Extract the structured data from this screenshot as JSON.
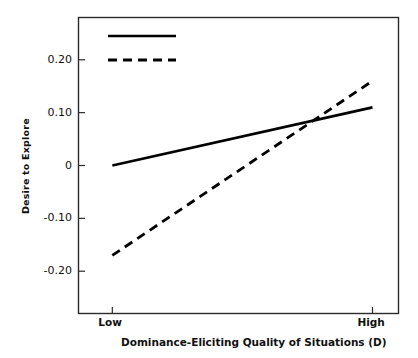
{
  "chart_data": {
    "type": "line",
    "title": "",
    "subtitle": "",
    "xlabel": "Dominance-Eliciting Quality of Situations (D)",
    "xlabel_plain": "Dominance-Eliciting Quality of Situations",
    "xlabel_bold_suffix": "(D)",
    "ylabel": "Desire to Explore",
    "categories": [
      "Low",
      "High"
    ],
    "x": [
      0,
      1
    ],
    "xtick_labels": [
      "Low",
      "High"
    ],
    "ytick_labels": [
      "0.20",
      "0.10",
      "0",
      "-0.10",
      "-0.20"
    ],
    "ytick_values": [
      0.2,
      0.1,
      0,
      -0.1,
      -0.2
    ],
    "ylim": [
      -0.28,
      0.28
    ],
    "xlim": [
      -0.13,
      1.1
    ],
    "grid": false,
    "legend_position": "top-left-inside",
    "series": [
      {
        "name": "Male",
        "style": "solid",
        "color": "#000000",
        "values": [
          0.0,
          0.11
        ]
      },
      {
        "name": "Female",
        "style": "dashed",
        "color": "#000000",
        "values": [
          -0.17,
          0.16
        ]
      }
    ],
    "annotations": []
  },
  "legend": {
    "items": [
      {
        "label": "Male",
        "style": "solid"
      },
      {
        "label": "Female",
        "style": "dashed"
      }
    ]
  },
  "axes": {
    "y_title": "Desire to Explore",
    "x_title_main": "Dominance-Eliciting Quality of Situations ",
    "x_title_bold": "(D)",
    "y_ticks": [
      "0.20",
      "0.10",
      "0",
      "-0.10",
      "-0.20"
    ],
    "x_ticks": [
      "Low",
      "High"
    ]
  }
}
